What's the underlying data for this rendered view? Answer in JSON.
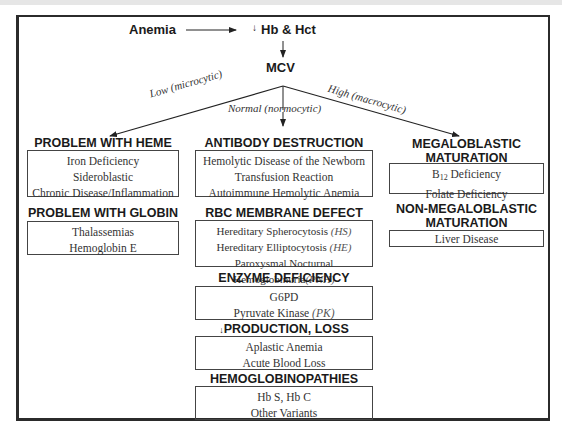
{
  "top": {
    "anemia": "Anemia",
    "hb_hct_arrow": "↓",
    "hb_hct": "Hb & Hct",
    "mcv": "MCV"
  },
  "branches": {
    "low": "Low (microcytic)",
    "normal": "Normal (normocytic)",
    "high": "High (macrocytic)"
  },
  "left": {
    "heme": {
      "title": "PROBLEM WITH HEME",
      "items": [
        "Iron Deficiency",
        "Sideroblastic",
        "Chronic Disease/Inflammation"
      ]
    },
    "globin": {
      "title": "PROBLEM WITH GLOBIN",
      "items": [
        "Thalassemias",
        "Hemoglobin E"
      ]
    }
  },
  "center": {
    "antibody": {
      "title": "ANTIBODY DESTRUCTION",
      "items": [
        "Hemolytic Disease of the Newborn",
        "Transfusion Reaction",
        "Autoimmune Hemolytic Anemia"
      ]
    },
    "membrane": {
      "title": "RBC MEMBRANE DEFECT",
      "items": [
        {
          "text": "Hereditary Spherocytosis ",
          "abbr": "(HS)"
        },
        {
          "text": "Hereditary Elliptocytosis ",
          "abbr": "(HE)"
        },
        {
          "text": "Paroxysmal Nocturnal Hemoglobinuria",
          "abbr": "(PNH)"
        }
      ]
    },
    "enzyme": {
      "title": "ENZYME DEFICIENCY",
      "items": [
        {
          "text": "G6PD",
          "abbr": ""
        },
        {
          "text": "Pyruvate Kinase ",
          "abbr": "(PK)"
        }
      ]
    },
    "production": {
      "arrow": "↓",
      "title": "PRODUCTION, LOSS",
      "items": [
        "Aplastic Anemia",
        "Acute Blood Loss"
      ]
    },
    "hemoglobinopathies": {
      "title": "HEMOGLOBINOPATHIES",
      "items": [
        "Hb S, Hb C",
        "Other Variants"
      ]
    }
  },
  "right": {
    "megaloblastic": {
      "title_line1": "MEGALOBLASTIC",
      "title_line2": "MATURATION",
      "items": [
        {
          "prefix": "B",
          "sub": "12",
          "text": " Deficiency"
        },
        {
          "prefix": "",
          "sub": "",
          "text": "Folate Deficiency"
        }
      ]
    },
    "non_megaloblastic": {
      "title_line1": "NON-MEGALOBLASTIC",
      "title_line2": "MATURATION",
      "items": [
        "Liver Disease"
      ]
    }
  }
}
